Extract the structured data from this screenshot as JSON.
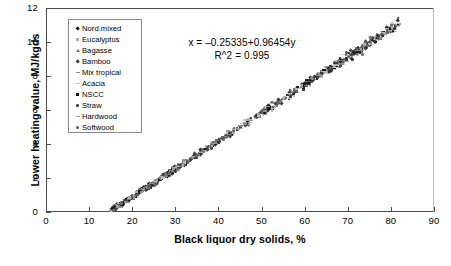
{
  "chart_data": {
    "type": "scatter",
    "title": "",
    "xlabel": "Black liquor dry solids, %",
    "ylabel": "Lower heating value, MJ/kgds",
    "xlim": [
      0,
      90
    ],
    "ylim": [
      0,
      12
    ],
    "xticks": [
      0,
      10,
      20,
      30,
      40,
      50,
      60,
      70,
      80,
      90
    ],
    "yticks": [
      0,
      2,
      4,
      6,
      8,
      10,
      12
    ],
    "grid": false,
    "legend_position": "upper-left-inside",
    "annotations": [
      "x = –0.25335+0.96454y",
      "R^2 = 0.995"
    ],
    "fit": {
      "equation": "x = –0.25335+0.96454y",
      "r_squared": 0.995,
      "intercept": -0.25335,
      "slope": 0.96454
    },
    "series": [
      {
        "name": "Nord.mixed",
        "marker": "diamond",
        "color": "#1a1a1a"
      },
      {
        "name": "Eucalyptus",
        "marker": "square",
        "color": "#b0b0b0"
      },
      {
        "name": "Bagasse",
        "marker": "triangle",
        "color": "#707070"
      },
      {
        "name": "Bamboo",
        "marker": "diamond",
        "color": "#3c3c3c"
      },
      {
        "name": "Mix tropical",
        "marker": "dash",
        "color": "#8a8a8a"
      },
      {
        "name": "Acacia",
        "marker": "dash",
        "color": "#c4c4c4"
      },
      {
        "name": "NSCC",
        "marker": "square",
        "color": "#111111"
      },
      {
        "name": "Straw",
        "marker": "dot",
        "color": "#2b2b2b"
      },
      {
        "name": "Hardwood",
        "marker": "dash",
        "color": "#9a9a9a"
      },
      {
        "name": "Softwood",
        "marker": "dot",
        "color": "#555555"
      }
    ]
  },
  "axes": {
    "x_tick_labels": [
      "0",
      "10",
      "20",
      "30",
      "40",
      "50",
      "60",
      "70",
      "80",
      "90"
    ],
    "y_tick_labels": [
      "0",
      "2",
      "4",
      "6",
      "8",
      "10",
      "12"
    ],
    "x_title": "Black liquor dry solids, %",
    "y_title": "Lower heating value, MJ/kgds"
  },
  "legend": {
    "items": [
      {
        "label": "Nord.mixed"
      },
      {
        "label": "Eucalyptus"
      },
      {
        "label": "Bagasse"
      },
      {
        "label": "Bamboo"
      },
      {
        "label": "Mix tropical"
      },
      {
        "label": "Acacia"
      },
      {
        "label": "NSCC"
      },
      {
        "label": "Straw"
      },
      {
        "label": "Hardwood"
      },
      {
        "label": "Softwood"
      }
    ]
  },
  "equation_block": {
    "line1": "x = –0.25335+0.96454y",
    "line2": "R^2 = 0.995"
  }
}
